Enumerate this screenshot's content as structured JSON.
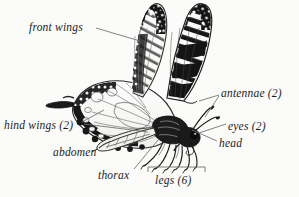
{
  "figure": {
    "view": "side view, wings raised",
    "style": "black-and-white scientific illustration",
    "background_color": "#fbfbf9",
    "ink_color": "#1b1b1b",
    "leader_line_color": "#6e6e6e"
  },
  "labels": [
    {
      "id": "front-wings",
      "text": "front wings"
    },
    {
      "id": "hind-wings",
      "text": "hind wings (2)"
    },
    {
      "id": "abdomen",
      "text": "abdomen"
    },
    {
      "id": "thorax",
      "text": "thorax"
    },
    {
      "id": "antennae",
      "text": "antennae (2)"
    },
    {
      "id": "eyes",
      "text": "eyes (2)"
    },
    {
      "id": "head",
      "text": "head"
    },
    {
      "id": "legs",
      "text": "legs (6)"
    }
  ],
  "bracket": {
    "for": "legs (6)",
    "orientation": "horizontal-below-legs"
  }
}
